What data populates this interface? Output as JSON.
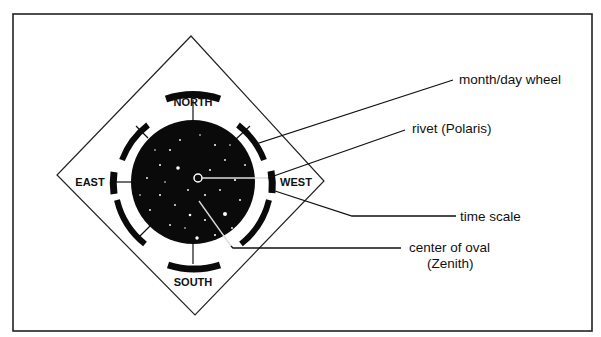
{
  "diagram": {
    "type": "planisphere-parts",
    "directions": {
      "north": "NORTH",
      "south": "SOUTH",
      "east": "EAST",
      "west": "WEST"
    },
    "callouts": [
      {
        "id": "month-day-wheel",
        "label": "month/day wheel"
      },
      {
        "id": "rivet",
        "label": "rivet (Polaris)"
      },
      {
        "id": "time-scale",
        "label": "time scale"
      },
      {
        "id": "center-of-oval",
        "label": "center of oval",
        "sublabel": "(Zenith)"
      }
    ],
    "colors": {
      "ink": "#111111",
      "sky": "#0a0a0a",
      "star": "#ffffff",
      "background": "#ffffff"
    }
  }
}
